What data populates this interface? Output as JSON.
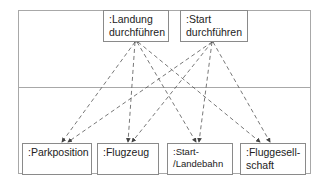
{
  "diagram": {
    "type": "communication-dependency",
    "upper_layer": {
      "objects": [
        {
          "id": "landung",
          "label": ":Landung\ndurchführen"
        },
        {
          "id": "start",
          "label": ":Start\ndurchführen"
        }
      ]
    },
    "lower_layer": {
      "objects": [
        {
          "id": "parkposition",
          "label": ":Parkposition"
        },
        {
          "id": "flugzeug",
          "label": ":Flugzeug"
        },
        {
          "id": "bahn",
          "label": ":Start-\n/Landebahn"
        },
        {
          "id": "fluggesellschaft",
          "label": ":Fluggesell-\nschaft"
        }
      ]
    },
    "dependencies": [
      {
        "from": "landung",
        "to": "parkposition",
        "style": "dashed"
      },
      {
        "from": "landung",
        "to": "flugzeug",
        "style": "dashed"
      },
      {
        "from": "landung",
        "to": "bahn",
        "style": "dashed"
      },
      {
        "from": "landung",
        "to": "fluggesellschaft",
        "style": "dashed"
      },
      {
        "from": "start",
        "to": "parkposition",
        "style": "dashed"
      },
      {
        "from": "start",
        "to": "flugzeug",
        "style": "dashed"
      },
      {
        "from": "start",
        "to": "bahn",
        "style": "dashed"
      },
      {
        "from": "start",
        "to": "fluggesellschaft",
        "style": "dashed"
      }
    ],
    "colors": {
      "frame": "#a8a8a8",
      "box_border": "#8a8a8a",
      "arrow": "#555555",
      "text": "#222222"
    }
  }
}
